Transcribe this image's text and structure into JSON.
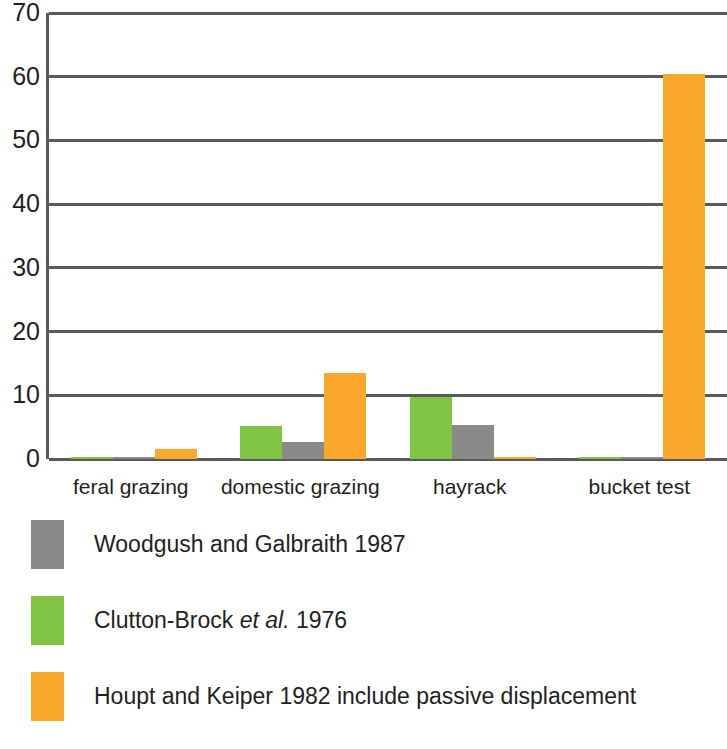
{
  "chart_data": {
    "type": "bar",
    "title": "",
    "subtitle": "",
    "xlabel": "",
    "ylabel": "",
    "ylim": [
      0,
      70
    ],
    "yticks": [
      0,
      10,
      20,
      30,
      40,
      50,
      60,
      70
    ],
    "ytick_labels": [
      "0",
      "10",
      "20",
      "30",
      "40",
      "50",
      "60",
      "70"
    ],
    "grid": true,
    "grid_axis": "y",
    "legend_position": "below-plot",
    "bar_order_in_group": [
      "Clutton-Brock et al. 1976",
      "Woodgush and Galbraith 1987",
      "Houpt and Keiper 1982 include passive displacement"
    ],
    "categories": [
      "feral grazing",
      "domestic grazing",
      "hayrack",
      "bucket test"
    ],
    "series": [
      {
        "name": "Woodgush and Galbraith 1987",
        "color": "#8a8a8a",
        "values": [
          0.2,
          2.7,
          5.4,
          0.2
        ]
      },
      {
        "name": "Clutton-Brock et al. 1976",
        "color": "#81c342",
        "values": [
          0.2,
          5.2,
          9.7,
          0.2
        ]
      },
      {
        "name": "Houpt and Keiper 1982 include passive displacement",
        "color": "#f9a82b",
        "values": [
          1.5,
          13.5,
          0.3,
          60.5
        ]
      }
    ]
  },
  "axis": {
    "y_ticks": [
      "70",
      "60",
      "50",
      "40",
      "30",
      "20",
      "10",
      "0"
    ],
    "x_ticks": [
      "feral grazing",
      "domestic grazing",
      "hayrack",
      "bucket test"
    ]
  },
  "legend": {
    "items": [
      {
        "swatch_name": "legend-swatch-gray",
        "color": "#8a8a8a",
        "label_pre": "Woodgush and Galbraith 1987",
        "label_italic": "",
        "label_post": ""
      },
      {
        "swatch_name": "legend-swatch-green",
        "color": "#81c342",
        "label_pre": "Clutton-Brock ",
        "label_italic": "et al.",
        "label_post": " 1976"
      },
      {
        "swatch_name": "legend-swatch-orange",
        "color": "#f9a82b",
        "label_pre": "Houpt and Keiper 1982 include passive displacement",
        "label_italic": "",
        "label_post": ""
      }
    ]
  },
  "colors": {
    "gray": "#8a8a8a",
    "green": "#81c342",
    "orange": "#f9a82b",
    "axis": "#58595b",
    "text": "#231f20",
    "background": "#ffffff"
  }
}
